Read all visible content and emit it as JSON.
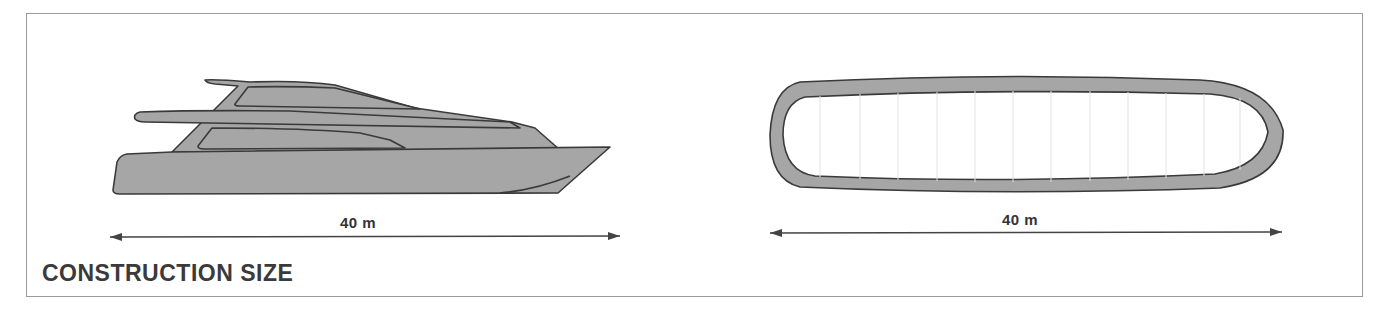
{
  "title": "CONSTRUCTION SIZE",
  "figures": [
    {
      "name": "ship-side-view",
      "dimension_label": "40 m"
    },
    {
      "name": "ring-top-view",
      "dimension_label": "40 m"
    }
  ],
  "colors": {
    "fill": "#a6a6a6",
    "outline": "#3a3a3a",
    "frame": "#9a9a9a",
    "text": "#333333"
  }
}
